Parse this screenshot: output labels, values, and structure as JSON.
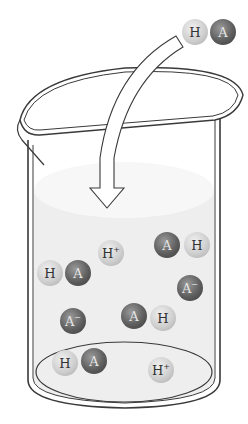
{
  "diagram": {
    "incoming_molecule": {
      "labels": [
        "H",
        "A"
      ]
    },
    "particles": [
      {
        "id": "p1",
        "label": "H",
        "sup": "+",
        "kind": "h",
        "x": 98,
        "y": 240
      },
      {
        "id": "p2",
        "label": "A",
        "sup": "",
        "kind": "a",
        "x": 154,
        "y": 232
      },
      {
        "id": "p3",
        "label": "H",
        "sup": "",
        "kind": "h",
        "x": 184,
        "y": 232
      },
      {
        "id": "p4",
        "label": "H",
        "sup": "",
        "kind": "h",
        "x": 37,
        "y": 260
      },
      {
        "id": "p5",
        "label": "A",
        "sup": "",
        "kind": "a",
        "x": 65,
        "y": 260
      },
      {
        "id": "p6",
        "label": "A",
        "sup": "−",
        "kind": "a",
        "x": 177,
        "y": 275
      },
      {
        "id": "p7",
        "label": "A",
        "sup": "−",
        "kind": "a",
        "x": 60,
        "y": 308
      },
      {
        "id": "p8",
        "label": "A",
        "sup": "",
        "kind": "a",
        "x": 121,
        "y": 303
      },
      {
        "id": "p9",
        "label": "H",
        "sup": "",
        "kind": "h",
        "x": 150,
        "y": 305
      },
      {
        "id": "p10",
        "label": "H",
        "sup": "",
        "kind": "h",
        "x": 52,
        "y": 350
      },
      {
        "id": "p11",
        "label": "A",
        "sup": "",
        "kind": "a",
        "x": 81,
        "y": 348
      },
      {
        "id": "p12",
        "label": "H",
        "sup": "+",
        "kind": "h",
        "x": 148,
        "y": 357
      }
    ],
    "colors": {
      "outline": "#3a3a3a",
      "liquid": "#eeeeee",
      "liquid_top": "#f6f6f6",
      "h_particle": "#c8c8c8",
      "a_particle": "#555555"
    }
  }
}
